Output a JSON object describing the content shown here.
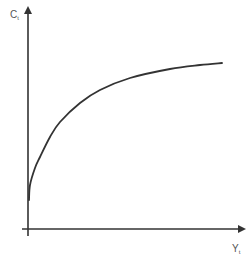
{
  "chart_data": {
    "type": "line",
    "title": "",
    "xlabel": "Y",
    "xlabel_subscript": "t",
    "ylabel": "C",
    "ylabel_subscript": "t",
    "grid": false,
    "legend": null,
    "tick_labels": false,
    "series": [
      {
        "name": "C(Y)",
        "points_px": [
          [
            29,
            200
          ],
          [
            30,
            185
          ],
          [
            35,
            168
          ],
          [
            40,
            157
          ],
          [
            50,
            137
          ],
          [
            60,
            122
          ],
          [
            80,
            103
          ],
          [
            100,
            90
          ],
          [
            130,
            78
          ],
          [
            170,
            69
          ],
          [
            200,
            65
          ],
          [
            222,
            63
          ]
        ]
      }
    ],
    "colors": {
      "axis": "#333333",
      "curve": "#333333",
      "label": "#555555",
      "background": "#ffffff"
    }
  },
  "labels": {
    "y_main": "C",
    "y_sub": "t",
    "x_main": "Y",
    "x_sub": "t"
  }
}
